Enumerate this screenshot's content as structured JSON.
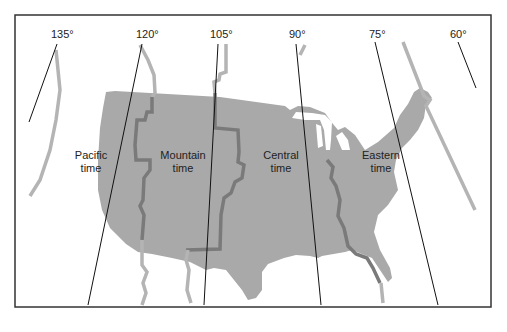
{
  "map": {
    "title": "U.S. time zones and meridians",
    "colors": {
      "land": "#a9a9a9",
      "zone_boundary_on_land": "#7a7a7a",
      "zone_boundary_off_land": "#b4b4b4",
      "meridian": "#111111",
      "frame": "#333333"
    },
    "meridians": [
      {
        "label": "135°",
        "degrees": 135
      },
      {
        "label": "120°",
        "degrees": 120
      },
      {
        "label": "105°",
        "degrees": 105
      },
      {
        "label": "90°",
        "degrees": 90
      },
      {
        "label": "75°",
        "degrees": 75
      },
      {
        "label": "60°",
        "degrees": 60
      }
    ],
    "zones": [
      {
        "name": "Pacific",
        "line1": "Pacific",
        "line2": "time"
      },
      {
        "name": "Mountain",
        "line1": "Mountain",
        "line2": "time"
      },
      {
        "name": "Central",
        "line1": "Central",
        "line2": "time"
      },
      {
        "name": "Eastern",
        "line1": "Eastern",
        "line2": "time"
      }
    ]
  }
}
